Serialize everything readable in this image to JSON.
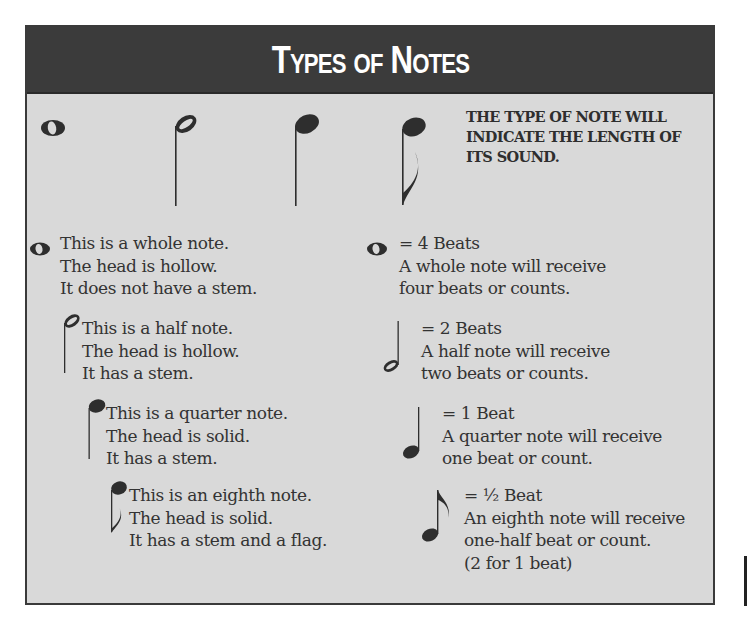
{
  "title": "Types of Notes",
  "caption": "The type of note will indicate the length of its sound.",
  "top_row_icons": [
    "whole-note-icon",
    "half-note-icon",
    "quarter-note-icon",
    "eighth-note-icon"
  ],
  "descriptions": [
    {
      "note": "whole",
      "lines": [
        "This is a whole note.",
        "The head is hollow.",
        "It does not have a stem."
      ]
    },
    {
      "note": "half",
      "lines": [
        "This is a half note.",
        "The head is hollow.",
        "It has a stem."
      ]
    },
    {
      "note": "quarter",
      "lines": [
        "This is a quarter note.",
        "The head is solid.",
        "It has a stem."
      ]
    },
    {
      "note": "eighth",
      "lines": [
        "This is an eighth note.",
        "The head is solid.",
        "It has a stem and a flag."
      ]
    }
  ],
  "values": [
    {
      "note": "whole",
      "beats": "= 4 Beats",
      "lines": [
        "A whole note will receive",
        "four beats or counts."
      ]
    },
    {
      "note": "half",
      "beats": "= 2 Beats",
      "lines": [
        "A half note will receive",
        "two beats or counts."
      ]
    },
    {
      "note": "quarter",
      "beats": "= 1 Beat",
      "lines": [
        "A quarter note will receive",
        "one beat or count."
      ]
    },
    {
      "note": "eighth",
      "beats": "= ½ Beat",
      "lines": [
        "An eighth note will receive",
        "one-half beat or count.",
        "(2 for 1 beat)"
      ]
    }
  ],
  "colors": {
    "header_bg": "#3b3b3b",
    "panel_bg": "#d9d9d9",
    "ink": "#2e2e2e",
    "title_text": "#ffffff"
  }
}
